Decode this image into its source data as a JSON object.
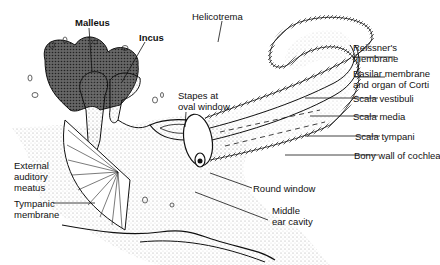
{
  "diagram": {
    "labels": {
      "malleus": "Malleus",
      "incus": "Incus",
      "helicotrema": "Helicotrema",
      "reissner": "Reissner's\nmembrane",
      "basilar": "Basilar membrane\nand organ of Corti",
      "scala_vestibuli": "Scala vestibuli",
      "scala_media": "Scala media",
      "scala_tympani": "Scala tympani",
      "bony_wall": "Bony wall of cochlea",
      "stapes": "Stapes at\noval window",
      "round_window": "Round window",
      "middle_ear": "Middle\near cavity",
      "external_meatus": "External\nauditory\nmeatus",
      "tympanic": "Tympanic\nmembrane"
    },
    "colors": {
      "ink": "#111111",
      "bone": "#555555",
      "stipple": "#cccccc"
    }
  }
}
